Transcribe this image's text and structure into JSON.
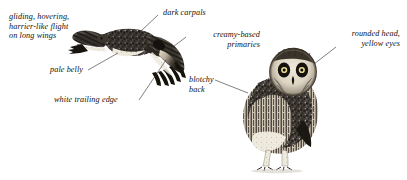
{
  "plate": {
    "title": "Short-eared Owl field guide plate",
    "background_color": "#ffffff",
    "ink_color": "#111111",
    "width": 407,
    "height": 180
  },
  "labels": {
    "flight": {
      "line1": "gliding, hovering,",
      "line2": "harrier-like flight",
      "line3": "on long wings"
    },
    "pale_belly": "pale belly",
    "white_trailing_edge": "white trailing edge",
    "dark_carpals": "dark carpals",
    "creamy_primaries": {
      "line1": "creamy-based",
      "line2": "primaries"
    },
    "blotchy_back": {
      "line1": "blotchy",
      "line2": "back"
    },
    "rounded_head": {
      "line1": "rounded head,",
      "line2": "yellow eyes"
    }
  },
  "figures": {
    "flying_bird": "short-eared-owl-in-flight",
    "perched_bird": "short-eared-owl-perched"
  }
}
